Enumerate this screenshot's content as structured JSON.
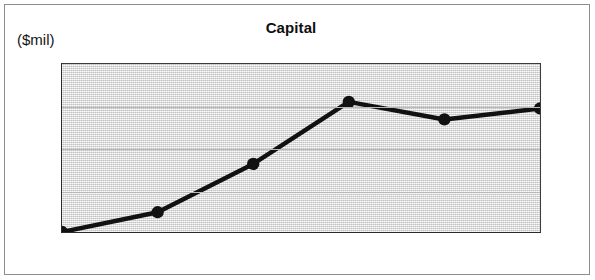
{
  "chart_data": {
    "type": "line",
    "title": "Capital",
    "ylabel": "($mil)",
    "xlabel": "",
    "categories": [
      "2004",
      "2005",
      "2006",
      "2007",
      "2008",
      "3-09"
    ],
    "values": [
      500,
      547,
      662,
      810,
      768,
      794
    ],
    "series": [
      {
        "name": "Capital",
        "values": [
          500,
          547,
          662,
          810,
          768,
          794
        ]
      }
    ],
    "ylim": [
      500,
      900
    ],
    "y_major_ticks": [
      500,
      600,
      700,
      800,
      900
    ],
    "y_tick_labels": [
      "500",
      "600",
      "700",
      "800",
      "900"
    ],
    "y_minor_ticks": [
      550,
      650,
      750,
      850
    ],
    "grid": true,
    "legend": "none",
    "marker": "filled-circle",
    "line_color": "#111111",
    "marker_color": "#111111",
    "plot_background": "#e2e2e2",
    "grid_color": "#b9b9b9",
    "axis_color": "#2b2b2b",
    "frame_color": "#8d8d8d"
  }
}
